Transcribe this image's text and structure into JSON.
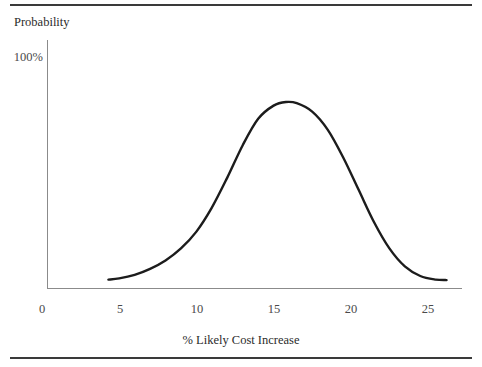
{
  "figure": {
    "background_color": "#ffffff",
    "rule_color": "#3a3a3a",
    "axis_color": "#8b8b8b",
    "curve_color": "#1c1c1c"
  },
  "chart_data": {
    "type": "line",
    "title": "",
    "subtitle": "",
    "xlabel": "% Likely Cost Increase",
    "ylabel": "Probability",
    "ylabel_position": "top-left",
    "xlim": [
      0,
      26.9
    ],
    "ylim": [
      0,
      1.12
    ],
    "xticks": [
      0,
      5,
      10,
      15,
      20,
      25
    ],
    "xticklabels": [
      "0",
      "5",
      "10",
      "15",
      "20",
      "25"
    ],
    "yticks": [
      1.0
    ],
    "yticklabels": [
      "100%"
    ],
    "grid": false,
    "legend": null,
    "annotations": [],
    "series": [
      {
        "name": "Probability distribution of cost increase",
        "shape": "bell-curve",
        "x": [
          4.3,
          5.0,
          6.0,
          7.0,
          8.0,
          9.0,
          10.0,
          11.0,
          12.0,
          13.0,
          14.0,
          15.0,
          15.8,
          16.5,
          17.5,
          18.5,
          19.5,
          20.5,
          21.5,
          22.5,
          23.5,
          24.5,
          25.5,
          26.2
        ],
        "y": [
          0.035,
          0.04,
          0.055,
          0.08,
          0.115,
          0.165,
          0.235,
          0.335,
          0.46,
          0.595,
          0.705,
          0.76,
          0.775,
          0.77,
          0.735,
          0.66,
          0.545,
          0.41,
          0.275,
          0.165,
          0.09,
          0.05,
          0.035,
          0.033
        ]
      }
    ]
  },
  "labels": {
    "y_axis_title": "Probability",
    "x_axis_title": "% Likely Cost Increase",
    "y_tick_100": "100%",
    "x_tick_0": "0",
    "x_tick_5": "5",
    "x_tick_10": "10",
    "x_tick_15": "15",
    "x_tick_20": "20",
    "x_tick_25": "25"
  }
}
